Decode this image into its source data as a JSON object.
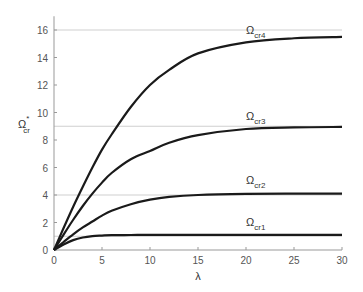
{
  "chart_data": {
    "type": "line",
    "title": "",
    "xlabel": "λ",
    "ylabel": "Ω*cr",
    "xlim": [
      0,
      30
    ],
    "ylim": [
      0,
      17
    ],
    "xticks": [
      0,
      5,
      10,
      15,
      20,
      25,
      30
    ],
    "yticks": [
      0,
      2,
      4,
      6,
      8,
      10,
      12,
      14,
      16
    ],
    "grid": false,
    "reference_lines_y": [
      1,
      4,
      9,
      16
    ],
    "x": [
      0,
      1,
      2,
      3,
      4,
      5,
      6,
      8,
      10,
      12,
      15,
      20,
      25,
      30
    ],
    "series": [
      {
        "name": "Ωcr1",
        "label_main": "Ω",
        "label_sub": "cr1",
        "values": [
          0,
          0.4,
          0.72,
          0.91,
          1.01,
          1.05,
          1.08,
          1.09,
          1.1,
          1.1,
          1.1,
          1.1,
          1.1,
          1.1
        ]
      },
      {
        "name": "Ωcr2",
        "label_main": "Ω",
        "label_sub": "cr2",
        "values": [
          0,
          0.58,
          1.14,
          1.64,
          2.07,
          2.5,
          2.85,
          3.33,
          3.66,
          3.86,
          4.0,
          4.08,
          4.1,
          4.1
        ]
      },
      {
        "name": "Ωcr3",
        "label_main": "Ω",
        "label_sub": "cr3",
        "values": [
          0,
          1.12,
          2.2,
          3.2,
          4.1,
          4.9,
          5.6,
          6.6,
          7.2,
          7.8,
          8.35,
          8.8,
          8.92,
          8.95
        ]
      },
      {
        "name": "Ωcr4",
        "label_main": "Ω",
        "label_sub": "cr4",
        "values": [
          0,
          1.6,
          3.15,
          4.6,
          6.0,
          7.3,
          8.4,
          10.4,
          12.0,
          13.1,
          14.3,
          15.1,
          15.4,
          15.5
        ]
      }
    ]
  }
}
